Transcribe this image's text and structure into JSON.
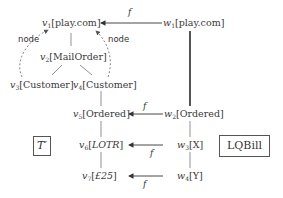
{
  "diagram": {
    "left_tree": {
      "v1": {
        "var": "v",
        "sub": "1",
        "label": "play.com"
      },
      "v2": {
        "var": "v",
        "sub": "2",
        "label": "MailOrder"
      },
      "v3": {
        "var": "v",
        "sub": "3",
        "label": "Customer"
      },
      "v4": {
        "var": "v",
        "sub": "4",
        "label": "Customer"
      },
      "v5": {
        "var": "v",
        "sub": "5",
        "label": "Ordered"
      },
      "v6": {
        "var": "v",
        "sub": "6",
        "label": "LOTR"
      },
      "v7": {
        "var": "v",
        "sub": "7",
        "label": "£25"
      }
    },
    "right_tree": {
      "w1": {
        "var": "w",
        "sub": "1",
        "label": "play.com"
      },
      "w2": {
        "var": "w",
        "sub": "2",
        "label": "Ordered"
      },
      "w3": {
        "var": "w",
        "sub": "3",
        "label": "X"
      },
      "w4": {
        "var": "w",
        "sub": "4",
        "label": "Y"
      }
    },
    "mapping_label": "f",
    "node_edge_label": "node",
    "left_tree_name": "T′",
    "right_tree_name": "LQBill"
  }
}
